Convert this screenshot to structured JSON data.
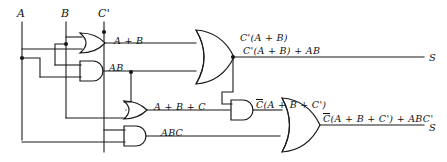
{
  "diagram": {
    "type": "logic-circuit-schematic",
    "background_color": "#ffffff",
    "line_color": "#1a1a1a"
  },
  "inputs": [
    {
      "id": "in-a",
      "label": "A",
      "x": 20,
      "y": 14
    },
    {
      "id": "in-b",
      "label": "B",
      "x": 62,
      "y": 14
    },
    {
      "id": "in-c",
      "label": "C'",
      "x": 100,
      "y": 14
    }
  ],
  "gates": [
    {
      "id": "gate-or-ab",
      "kind": "or",
      "label": "A + B",
      "label_x": 118,
      "label_y": 36
    },
    {
      "id": "gate-and-ab",
      "kind": "and",
      "label": "AB",
      "label_x": 110,
      "label_y": 65
    },
    {
      "id": "gate-or-top",
      "kind": "or",
      "label": "C'(A + B)",
      "label_x": 220,
      "label_y": 22
    },
    {
      "id": "gate-or-abc",
      "kind": "or",
      "label": "A + B + C",
      "label_x": 157,
      "label_y": 108
    },
    {
      "id": "gate-and-abc",
      "kind": "and",
      "label": "ABC",
      "label_x": 165,
      "label_y": 134
    },
    {
      "id": "gate-and-mid",
      "kind": "and",
      "label_overline": "C",
      "label_rest": "(A + B + C')",
      "label_x": 253,
      "label_y": 104
    },
    {
      "id": "gate-or-bot",
      "kind": "or",
      "label_overline": "C",
      "label_rest": "(A + B + C') + ABC'",
      "label_x": 330,
      "label_y": 117
    }
  ],
  "outputs": [
    {
      "id": "out-top",
      "label": "S",
      "expression": "C'(A + B) + AB",
      "expr_x": 243,
      "expr_y": 49,
      "sym_x": 433,
      "sym_y": 58
    },
    {
      "id": "out-bottom",
      "label": "S",
      "expression_overline": "C",
      "expression_rest": "(A + B + C') + ABC'",
      "sym_x": 433,
      "sym_y": 128
    }
  ],
  "junctions": [
    {
      "id": "node-c-top",
      "x": 104,
      "y": 32
    },
    {
      "id": "node-b-top",
      "x": 66,
      "y": 44
    },
    {
      "id": "node-a-mid",
      "x": 22,
      "y": 58
    },
    {
      "id": "node-ab-out",
      "x": 131,
      "y": 72
    },
    {
      "id": "node-or-out",
      "x": 233,
      "y": 58
    }
  ]
}
